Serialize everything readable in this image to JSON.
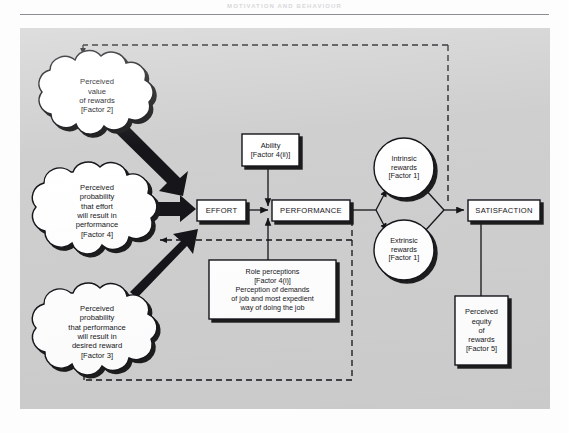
{
  "page": {
    "running_head": "MOTIVATION AND BEHAVIOUR",
    "background_color": "#cfcfcf",
    "ink_color": "#16161a",
    "node_fill": "#ffffff",
    "shadow_color": "#1a1a1a"
  },
  "diagram": {
    "type": "flow-diagram",
    "clouds": [
      {
        "id": "perceived-value-of-rewards",
        "lines": [
          "Perceived",
          "value",
          "of rewards",
          "[Factor 2]"
        ],
        "text": "Perceived value of rewards [Factor 2]",
        "cx": 77,
        "cy": 67,
        "rx": 56,
        "ry": 39
      },
      {
        "id": "perceived-probability-effort-performance",
        "lines": [
          "Perceived",
          "probability",
          "that effort",
          "will result in",
          "performance",
          "[Factor 4]"
        ],
        "text": "Perceived probability that effort will result in performance [Factor 4]",
        "cx": 77,
        "cy": 182,
        "rx": 58,
        "ry": 45
      },
      {
        "id": "perceived-probability-performance-reward",
        "lines": [
          "Perceived",
          "probability",
          "that performance",
          "will result in",
          "desired reward",
          "[Factor 3]"
        ],
        "text": "Perceived probability that performance will result in desired reward [Factor 3]",
        "cx": 77,
        "cy": 303,
        "rx": 58,
        "ry": 45
      }
    ],
    "boxes": [
      {
        "id": "ability",
        "lines": [
          "Ability",
          "[Factor 4(ii)]"
        ],
        "x": 222,
        "y": 106,
        "w": 57,
        "h": 30
      },
      {
        "id": "effort",
        "lines": [
          "EFFORT"
        ],
        "x": 175,
        "y": 172,
        "w": 49,
        "h": 20,
        "caps": true
      },
      {
        "id": "performance",
        "lines": [
          "PERFORMANCE"
        ],
        "x": 252,
        "y": 172,
        "w": 76,
        "h": 20,
        "caps": true
      },
      {
        "id": "satisfaction",
        "lines": [
          "SATISFACTION"
        ],
        "x": 448,
        "y": 172,
        "w": 72,
        "h": 20,
        "caps": true
      },
      {
        "id": "role-perceptions",
        "lines": [
          "Role perceptions",
          "[Factor 4(i)]",
          "Perception of demands",
          "of job and most expedient",
          "way of doing the job"
        ],
        "x": 197,
        "y": 234,
        "w": 118,
        "h": 57
      },
      {
        "id": "perceived-equity-of-rewards",
        "lines": [
          "Perceived",
          "equity",
          "of",
          "rewards",
          "[Factor 5]"
        ],
        "x": 435,
        "y": 270,
        "w": 52,
        "h": 67
      }
    ],
    "circles": [
      {
        "id": "intrinsic-rewards",
        "lines": [
          "Intrinsic",
          "rewards",
          "[Factor 1]"
        ],
        "cx": 384,
        "cy": 140,
        "r": 30
      },
      {
        "id": "extrinsic-rewards",
        "lines": [
          "Extrinsic",
          "rewards",
          "[Factor 1]"
        ],
        "cx": 384,
        "cy": 222,
        "r": 30
      }
    ],
    "thick_arrows": [
      {
        "id": "value-to-effort",
        "from": "perceived-value-of-rewards",
        "to": "effort"
      },
      {
        "id": "probability-effort-to-effort",
        "from": "perceived-probability-effort-performance",
        "to": "effort"
      },
      {
        "id": "probability-reward-to-effort",
        "from": "perceived-probability-performance-reward",
        "to": "effort"
      }
    ],
    "solid_arrows": [
      {
        "id": "effort-to-performance",
        "from": "effort",
        "to": "performance"
      },
      {
        "id": "ability-to-effort-performance-link",
        "from": "ability",
        "to": "effort-performance-link"
      },
      {
        "id": "role-perceptions-to-link",
        "from": "role-perceptions",
        "to": "effort-performance-link"
      },
      {
        "id": "performance-to-intrinsic",
        "from": "performance",
        "to": "intrinsic-rewards"
      },
      {
        "id": "performance-to-extrinsic",
        "from": "performance",
        "to": "extrinsic-rewards"
      },
      {
        "id": "intrinsic-to-satisfaction",
        "from": "intrinsic-rewards",
        "to": "satisfaction"
      },
      {
        "id": "extrinsic-to-satisfaction",
        "from": "extrinsic-rewards",
        "to": "satisfaction"
      },
      {
        "id": "equity-to-satisfaction",
        "from": "perceived-equity-of-rewards",
        "to": "satisfaction"
      }
    ],
    "dashed_feedback": [
      {
        "id": "satisfaction-to-perceived-value",
        "from": "satisfaction",
        "to": "perceived-value-of-rewards"
      },
      {
        "id": "performance-to-probability-effort",
        "from": "performance",
        "to": "perceived-probability-effort-performance"
      },
      {
        "id": "performance-to-probability-reward",
        "from": "performance",
        "to": "perceived-probability-performance-reward"
      }
    ]
  }
}
